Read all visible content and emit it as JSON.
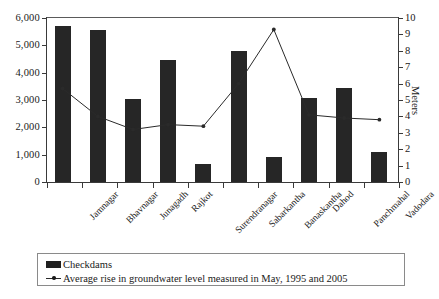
{
  "chart_data": {
    "type": "bar",
    "title": "",
    "subtitle": "",
    "xlabel": "",
    "ylabel": "",
    "grid": false,
    "legend_position": "bottom",
    "categories": [
      "Jamnagar",
      "Bhavnagar",
      "Junagadh",
      "Rajkot",
      "Surendranagar",
      "Sabarkantha",
      "Banaskantha",
      "Dahod",
      "Panchmahal",
      "Vadodara"
    ],
    "axes": {
      "left": {
        "label": "",
        "ylim": [
          0,
          6000
        ],
        "ticks": [
          0,
          1000,
          2000,
          3000,
          4000,
          5000,
          6000
        ],
        "tick_labels": [
          "0",
          "1,000",
          "2,000",
          "3,000",
          "4,000",
          "5,000",
          "6,000"
        ]
      },
      "right": {
        "label": "Meters",
        "ylim": [
          0,
          10
        ],
        "ticks": [
          0,
          1,
          2,
          3,
          4,
          5,
          6,
          7,
          8,
          9,
          10
        ],
        "tick_labels": [
          "0",
          "1",
          "2",
          "3",
          "4",
          "5",
          "6",
          "7",
          "8",
          "9",
          "10"
        ]
      }
    },
    "series": [
      {
        "name": "Checkdams",
        "type": "bar",
        "axis": "left",
        "color": "#262626",
        "values": [
          5700,
          5560,
          3050,
          4480,
          650,
          4800,
          900,
          3080,
          3450,
          1080
        ]
      },
      {
        "name": "Average rise in groundwater level measured in May, 1995 and 2005",
        "type": "line",
        "axis": "right",
        "color": "#2a2a2a",
        "values": [
          5.7,
          4.0,
          3.2,
          3.5,
          3.4,
          6.0,
          9.3,
          4.1,
          3.9,
          3.8
        ]
      }
    ]
  },
  "legend": {
    "items": [
      {
        "label": "Checkdams",
        "marker": "filled-square-swatch"
      },
      {
        "label": "Average rise in groundwater level measured in May, 1995 and 2005",
        "marker": "line-with-dot-marker"
      }
    ]
  }
}
